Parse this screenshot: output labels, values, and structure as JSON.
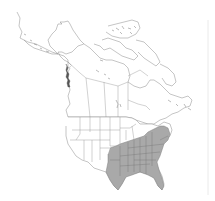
{
  "map": {
    "type": "species range map",
    "region": "North America",
    "shaded_region_label": "Southeastern United States",
    "colors": {
      "background": "#ffffff",
      "land": "#ffffff",
      "outline": "#8a8a8a",
      "range_fill": "#a9a9a9"
    },
    "range_states": [
      "Texas (east)",
      "Oklahoma (east)",
      "Arkansas",
      "Louisiana",
      "Missouri (south)",
      "Kentucky",
      "Tennessee",
      "Mississippi",
      "Alabama",
      "Georgia",
      "Florida",
      "South Carolina",
      "North Carolina",
      "Virginia",
      "West Virginia",
      "Maryland",
      "Delaware",
      "New Jersey",
      "Pennsylvania (south)",
      "Ohio (south)",
      "Indiana (south)",
      "Illinois (south)"
    ]
  }
}
